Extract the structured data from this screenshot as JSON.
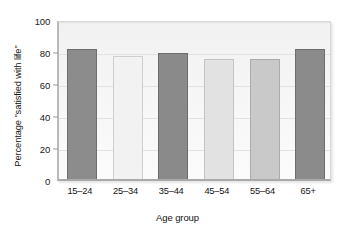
{
  "chart_data": {
    "type": "bar",
    "title": "",
    "xlabel": "Age group",
    "ylabel": "Percentage \"satisfied with life\"",
    "categories": [
      "15–24",
      "25–34",
      "35–44",
      "45–54",
      "55–64",
      "65+"
    ],
    "values": [
      81,
      77,
      79,
      75,
      75,
      81
    ],
    "ylim": [
      0,
      100
    ],
    "yticks": [
      0,
      20,
      40,
      60,
      80,
      100
    ],
    "ytick_labels": [
      "0",
      "20",
      "40",
      "60",
      "80",
      "100"
    ],
    "grid": true,
    "legend": "none",
    "bar_colors": [
      "#8c8c8c",
      "#f2f2f2",
      "#8a8a8a",
      "#e2e2e2",
      "#c9c9c9",
      "#8b8b8b"
    ],
    "bar_edge_colors": [
      "#6e6e6e",
      "#cfcfcf",
      "#6c6c6c",
      "#c4c4c4",
      "#ababab",
      "#6d6d6d"
    ],
    "plot_background": "#f4f4f4",
    "axis_color": "#a9a9a9",
    "gridline_color": "#e2e2e2",
    "text_color": "#141414"
  }
}
